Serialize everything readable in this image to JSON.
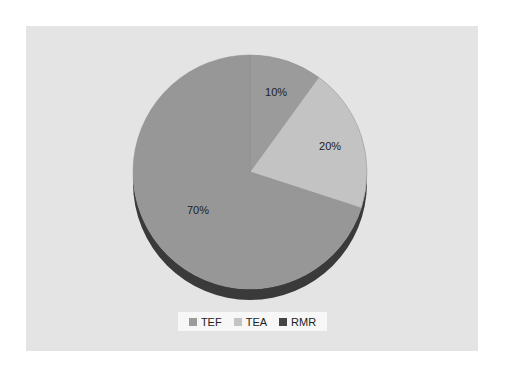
{
  "chart_data": {
    "type": "pie",
    "style": "3d",
    "title": "",
    "categories": [
      "TEF",
      "TEA",
      "RMR"
    ],
    "values": [
      10,
      20,
      70
    ],
    "labels": [
      "10%",
      "20%",
      "70%"
    ],
    "colors": [
      "#9b9b9b",
      "#c3c3c3",
      "#979797"
    ],
    "legend_colors": [
      "#9b9b9b",
      "#c3c3c3",
      "#454545"
    ],
    "side_color": "#3a3a3a",
    "legend_position": "bottom",
    "start_angle_deg": 0,
    "direction": "clockwise"
  },
  "legend": {
    "items": [
      {
        "label": "TEF",
        "color": "#9b9b9b"
      },
      {
        "label": "TEA",
        "color": "#c3c3c3"
      },
      {
        "label": "RMR",
        "color": "#454545"
      }
    ]
  },
  "colors": {
    "panel_bg": "#e4e4e4",
    "legend_bg": "#f7f7f7"
  }
}
